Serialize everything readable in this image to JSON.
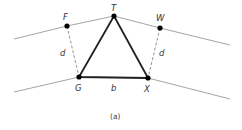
{
  "diagram": {
    "caption": "(a)",
    "points": {
      "T": {
        "label": "T",
        "x": 114,
        "y": 16
      },
      "F": {
        "label": "F",
        "x": 67,
        "y": 26
      },
      "W": {
        "label": "W",
        "x": 160,
        "y": 28
      },
      "G": {
        "label": "G",
        "x": 79,
        "y": 77
      },
      "X": {
        "label": "X",
        "x": 148,
        "y": 78
      }
    },
    "edge_labels": {
      "left_offset": "d",
      "right_offset": "d",
      "base": "b"
    },
    "colors": {
      "triangle": "#222222",
      "guide_lines": "#999999",
      "dashed": "#777777",
      "points": "#000000"
    }
  }
}
